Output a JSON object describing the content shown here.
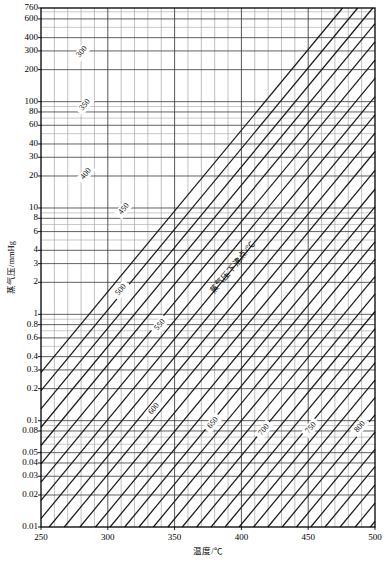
{
  "chart_data": {
    "type": "line",
    "title": "",
    "subtitle": "",
    "xlabel": "温度/℃",
    "ylabel": "蒸气压/mmHg",
    "xlim": [
      250,
      500
    ],
    "ylim": [
      0.01,
      760
    ],
    "yscale": "log",
    "xscale": "linear",
    "grid": true,
    "legend_position": "none",
    "annotation": "蒸气压下沸点/℃",
    "x_ticks_major": [
      250,
      300,
      350,
      400,
      450,
      500
    ],
    "x_tick_labels": [
      "250",
      "300",
      "350",
      "400",
      "450",
      "500"
    ],
    "x_minor_step": 10,
    "y_ticks": [
      760,
      600,
      400,
      300,
      200,
      100,
      80,
      60,
      40,
      30,
      20,
      10,
      8,
      6,
      4,
      3,
      2,
      1,
      0.8,
      0.6,
      0.4,
      0.3,
      0.2,
      0.1,
      0.08,
      0.05,
      0.04,
      0.03,
      0.02,
      0.01
    ],
    "y_tick_labels": [
      "760",
      "600",
      "400",
      "300",
      "200",
      "100",
      "80",
      "60",
      "40",
      "30",
      "20",
      "10",
      "8",
      "6",
      "4",
      "3",
      "2",
      "1",
      "0.8",
      "0.6",
      "0.4",
      "0.3",
      "0.2",
      "0.1",
      "0.08",
      "0.05",
      "0.04",
      "0.03",
      "0.02",
      "0.01"
    ],
    "y_minor_ticks": [
      700,
      500,
      90,
      70,
      50,
      9,
      7,
      5,
      0.9,
      0.7,
      0.5,
      0.09,
      0.07,
      0.06
    ],
    "diagonal_family_name": "蒸气压下沸点/℃",
    "diagonal_labels": [
      "300",
      "350",
      "400",
      "450",
      "500",
      "550",
      "600",
      "650",
      "700",
      "750",
      "800"
    ],
    "diagonal_values": [
      300,
      350,
      400,
      450,
      500,
      550,
      600,
      650,
      700,
      750,
      800
    ],
    "diagonal_label_positions": [
      {
        "label": "300",
        "x": 82,
        "y": 52
      },
      {
        "label": "350",
        "x": 85,
        "y": 105
      },
      {
        "label": "400",
        "x": 86,
        "y": 174
      },
      {
        "label": "450",
        "x": 124,
        "y": 209
      },
      {
        "label": "500",
        "x": 121,
        "y": 290
      },
      {
        "label": "550",
        "x": 160,
        "y": 325
      },
      {
        "label": "600",
        "x": 154,
        "y": 409
      },
      {
        "label": "650",
        "x": 213,
        "y": 423
      },
      {
        "label": "700",
        "x": 264,
        "y": 430
      },
      {
        "label": "750",
        "x": 311,
        "y": 428
      },
      {
        "label": "800",
        "x": 360,
        "y": 427
      }
    ],
    "series": [
      {
        "name": "300",
        "points": [
          [
            250,
            0.012
          ],
          [
            500,
            75
          ]
        ]
      },
      {
        "name": "350",
        "points": [
          [
            250,
            0.0045
          ],
          [
            500,
            34
          ]
        ]
      },
      {
        "name": "400",
        "points": [
          [
            250,
            0.0019
          ],
          [
            500,
            15
          ]
        ]
      },
      {
        "name": "450",
        "points": [
          [
            260,
            0.0012
          ],
          [
            500,
            7.0
          ]
        ]
      },
      {
        "name": "500",
        "points": [
          [
            275,
            0.0011
          ],
          [
            500,
            3.3
          ]
        ]
      },
      {
        "name": "550",
        "points": [
          [
            292,
            0.0011
          ],
          [
            500,
            1.55
          ]
        ]
      },
      {
        "name": "600",
        "points": [
          [
            308,
            0.0011
          ],
          [
            500,
            0.73
          ]
        ]
      },
      {
        "name": "650",
        "points": [
          [
            325,
            0.0011
          ],
          [
            500,
            0.35
          ]
        ]
      },
      {
        "name": "700",
        "points": [
          [
            341,
            0.0011
          ],
          [
            500,
            0.165
          ]
        ]
      },
      {
        "name": "750",
        "points": [
          [
            358,
            0.0011
          ],
          [
            500,
            0.078
          ]
        ]
      },
      {
        "name": "800",
        "points": [
          [
            375,
            0.0011
          ],
          [
            500,
            0.037
          ]
        ]
      }
    ]
  },
  "axes": {
    "x_title": "温度/℃",
    "y_title": "蒸气压/mmHg"
  }
}
